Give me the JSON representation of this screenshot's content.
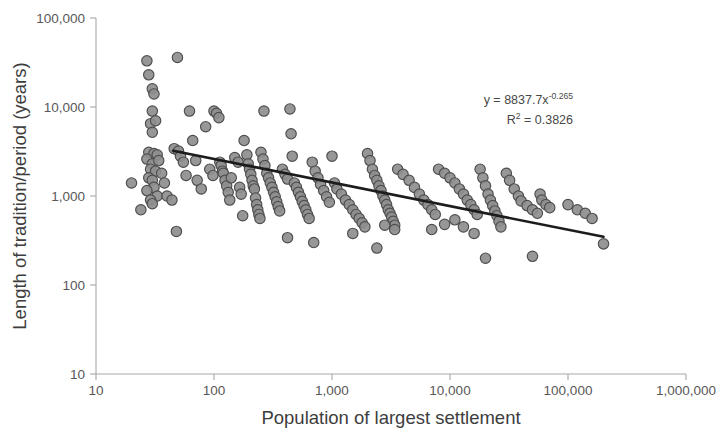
{
  "chart_data": {
    "type": "scatter",
    "title": "",
    "xlabel": "Population of largest settlement",
    "ylabel": "Length of tradition/period (years)",
    "xscale": "log",
    "yscale": "log",
    "xlim": [
      10,
      1000000
    ],
    "ylim": [
      10,
      100000
    ],
    "grid": false,
    "legend": null,
    "xticks": [
      10,
      100,
      1000,
      10000,
      100000,
      1000000
    ],
    "xtick_labels": [
      "10",
      "100",
      "1,000",
      "10,000",
      "100,000",
      "1,000,000"
    ],
    "yticks": [
      10,
      100,
      1000,
      10000,
      100000
    ],
    "ytick_labels": [
      "10",
      "100",
      "1,000",
      "10,000",
      "100,000"
    ],
    "annotations": [
      {
        "name": "regression-equation",
        "text": "y = 8837.7x",
        "exponent": "-0.265",
        "x": 0.73,
        "y": 0.22
      },
      {
        "name": "r-squared",
        "text": "R",
        "superscript": "2",
        "rest": " = 0.3826",
        "x": 0.73,
        "y": 0.28
      }
    ],
    "trendline": {
      "type": "power",
      "equation": "y = 8837.7x^-0.265",
      "coefficient": 8837.7,
      "exponent": -0.265,
      "r_squared": 0.3826,
      "x_start": 45,
      "x_end": 200000,
      "color": "#1c1c1c"
    },
    "marker": {
      "shape": "circle",
      "fill": "#8e8e8e",
      "stroke": "#4d4d4d",
      "radius": 5.2
    },
    "points": [
      [
        20,
        1400
      ],
      [
        27,
        33000
      ],
      [
        28,
        23000
      ],
      [
        30,
        16000
      ],
      [
        31,
        14000
      ],
      [
        30,
        9000
      ],
      [
        29,
        6500
      ],
      [
        32,
        7000
      ],
      [
        30,
        5200
      ],
      [
        28,
        3100
      ],
      [
        31,
        3000
      ],
      [
        33,
        2900
      ],
      [
        27,
        2600
      ],
      [
        30,
        2300
      ],
      [
        29,
        2000
      ],
      [
        32,
        1900
      ],
      [
        28,
        1600
      ],
      [
        30,
        1500
      ],
      [
        31,
        1250
      ],
      [
        27,
        1150
      ],
      [
        33,
        1000
      ],
      [
        29,
        900
      ],
      [
        30,
        820
      ],
      [
        24,
        700
      ],
      [
        34,
        2500
      ],
      [
        36,
        1800
      ],
      [
        38,
        1400
      ],
      [
        40,
        1000
      ],
      [
        44,
        900
      ],
      [
        46,
        3400
      ],
      [
        49,
        36000
      ],
      [
        50,
        3200
      ],
      [
        52,
        2800
      ],
      [
        55,
        2400
      ],
      [
        58,
        1700
      ],
      [
        48,
        400
      ],
      [
        62,
        9000
      ],
      [
        66,
        4200
      ],
      [
        70,
        2500
      ],
      [
        72,
        1500
      ],
      [
        78,
        1200
      ],
      [
        85,
        6000
      ],
      [
        92,
        2000
      ],
      [
        98,
        1700
      ],
      [
        100,
        9000
      ],
      [
        105,
        8500
      ],
      [
        110,
        7600
      ],
      [
        112,
        2400
      ],
      [
        115,
        2200
      ],
      [
        118,
        1900
      ],
      [
        120,
        1800
      ],
      [
        124,
        1500
      ],
      [
        128,
        1300
      ],
      [
        132,
        1100
      ],
      [
        136,
        900
      ],
      [
        140,
        1600
      ],
      [
        150,
        2700
      ],
      [
        160,
        2400
      ],
      [
        165,
        1250
      ],
      [
        170,
        1050
      ],
      [
        175,
        600
      ],
      [
        180,
        4200
      ],
      [
        190,
        2900
      ],
      [
        195,
        2300
      ],
      [
        200,
        2000
      ],
      [
        205,
        1750
      ],
      [
        210,
        1500
      ],
      [
        215,
        1300
      ],
      [
        220,
        1200
      ],
      [
        225,
        950
      ],
      [
        230,
        800
      ],
      [
        235,
        700
      ],
      [
        240,
        620
      ],
      [
        245,
        560
      ],
      [
        250,
        3100
      ],
      [
        260,
        2600
      ],
      [
        265,
        9000
      ],
      [
        270,
        2200
      ],
      [
        280,
        1800
      ],
      [
        290,
        1600
      ],
      [
        300,
        1400
      ],
      [
        310,
        1250
      ],
      [
        320,
        1100
      ],
      [
        330,
        980
      ],
      [
        340,
        860
      ],
      [
        350,
        760
      ],
      [
        360,
        680
      ],
      [
        380,
        2000
      ],
      [
        400,
        1750
      ],
      [
        420,
        1550
      ],
      [
        440,
        9500
      ],
      [
        450,
        5000
      ],
      [
        460,
        2800
      ],
      [
        480,
        1400
      ],
      [
        500,
        1250
      ],
      [
        520,
        1100
      ],
      [
        540,
        980
      ],
      [
        560,
        870
      ],
      [
        580,
        780
      ],
      [
        600,
        700
      ],
      [
        620,
        620
      ],
      [
        640,
        560
      ],
      [
        680,
        2400
      ],
      [
        720,
        1900
      ],
      [
        760,
        1600
      ],
      [
        800,
        1350
      ],
      [
        850,
        1150
      ],
      [
        900,
        980
      ],
      [
        950,
        850
      ],
      [
        1000,
        2800
      ],
      [
        1050,
        1400
      ],
      [
        1100,
        1200
      ],
      [
        1200,
        1050
      ],
      [
        1300,
        900
      ],
      [
        1400,
        800
      ],
      [
        1500,
        700
      ],
      [
        1600,
        620
      ],
      [
        1700,
        560
      ],
      [
        1800,
        500
      ],
      [
        1900,
        450
      ],
      [
        2000,
        3000
      ],
      [
        2100,
        2500
      ],
      [
        2200,
        2000
      ],
      [
        2300,
        1700
      ],
      [
        2400,
        1500
      ],
      [
        2500,
        1300
      ],
      [
        2600,
        1150
      ],
      [
        2700,
        1000
      ],
      [
        2800,
        900
      ],
      [
        2900,
        800
      ],
      [
        3000,
        700
      ],
      [
        3100,
        640
      ],
      [
        3200,
        580
      ],
      [
        3300,
        520
      ],
      [
        3400,
        470
      ],
      [
        2400,
        260
      ],
      [
        3600,
        2000
      ],
      [
        4000,
        1750
      ],
      [
        4500,
        1500
      ],
      [
        5000,
        1250
      ],
      [
        5500,
        1050
      ],
      [
        6000,
        900
      ],
      [
        6500,
        800
      ],
      [
        7000,
        700
      ],
      [
        7500,
        620
      ],
      [
        8000,
        2000
      ],
      [
        9000,
        1800
      ],
      [
        10000,
        1600
      ],
      [
        11000,
        1400
      ],
      [
        12000,
        1200
      ],
      [
        13000,
        1050
      ],
      [
        14000,
        900
      ],
      [
        15000,
        800
      ],
      [
        16000,
        700
      ],
      [
        17000,
        620
      ],
      [
        18000,
        2000
      ],
      [
        19000,
        1600
      ],
      [
        20000,
        1300
      ],
      [
        21000,
        1050
      ],
      [
        22000,
        900
      ],
      [
        23000,
        780
      ],
      [
        24000,
        680
      ],
      [
        25000,
        600
      ],
      [
        26000,
        520
      ],
      [
        27000,
        450
      ],
      [
        20000,
        200
      ],
      [
        7000,
        420
      ],
      [
        30000,
        1800
      ],
      [
        32000,
        1500
      ],
      [
        35000,
        1200
      ],
      [
        38000,
        1000
      ],
      [
        40000,
        880
      ],
      [
        45000,
        780
      ],
      [
        50000,
        700
      ],
      [
        55000,
        640
      ],
      [
        58000,
        1050
      ],
      [
        60000,
        900
      ],
      [
        65000,
        800
      ],
      [
        70000,
        740
      ],
      [
        50000,
        210
      ],
      [
        100000,
        800
      ],
      [
        120000,
        700
      ],
      [
        140000,
        640
      ],
      [
        160000,
        560
      ],
      [
        200000,
        290
      ],
      [
        13000,
        450
      ],
      [
        16000,
        380
      ],
      [
        9000,
        480
      ],
      [
        11000,
        540
      ],
      [
        2800,
        470
      ],
      [
        3400,
        420
      ],
      [
        1500,
        380
      ],
      [
        700,
        300
      ],
      [
        420,
        340
      ]
    ]
  }
}
